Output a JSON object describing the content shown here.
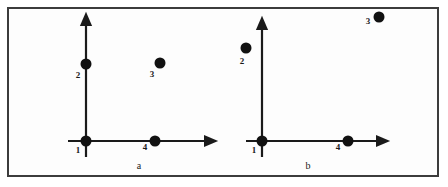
{
  "figure": {
    "title": "",
    "background_color": "#ffffff",
    "frame_color": "#3c3c3c",
    "node_color": "#111111",
    "axis_color": "#1a1a1a",
    "label_color": "#1a1a1a"
  },
  "chart_data": {
    "type": "scatter",
    "title": "",
    "xlabel": "",
    "ylabel": "",
    "grid": false,
    "legend": "none",
    "panels": [
      {
        "id": "a",
        "caption": "a",
        "caption_pos": {
          "x": 139,
          "y": 166
        },
        "origin": {
          "x": 86,
          "y": 141
        },
        "x_axis": {
          "x1": 68,
          "y1": 141,
          "x2": 205,
          "y2": 141,
          "arrow": "right"
        },
        "y_axis": {
          "x1": 86,
          "y1": 157,
          "x2": 86,
          "y2": 25,
          "arrow": "up"
        },
        "points": [
          {
            "label": "1",
            "x": 86,
            "y": 141,
            "r": 5.5,
            "label_x": 78,
            "label_y": 150,
            "on_axis": "origin"
          },
          {
            "label": "2",
            "x": 86,
            "y": 64,
            "r": 5.5,
            "label_x": 78,
            "label_y": 75,
            "on_axis": "y"
          },
          {
            "label": "3",
            "x": 160,
            "y": 63,
            "r": 5.5,
            "label_x": 152,
            "label_y": 74,
            "on_axis": "none"
          },
          {
            "label": "4",
            "x": 155,
            "y": 141,
            "r": 5.5,
            "label_x": 145,
            "label_y": 147,
            "on_axis": "x"
          }
        ]
      },
      {
        "id": "b",
        "caption": "b",
        "caption_pos": {
          "x": 308,
          "y": 166
        },
        "origin": {
          "x": 262,
          "y": 141
        },
        "x_axis": {
          "x1": 246,
          "y1": 141,
          "x2": 377,
          "y2": 141,
          "arrow": "right"
        },
        "y_axis": {
          "x1": 262,
          "y1": 157,
          "x2": 262,
          "y2": 29,
          "arrow": "up"
        },
        "points": [
          {
            "label": "1",
            "x": 262,
            "y": 141,
            "r": 5.5,
            "label_x": 254,
            "label_y": 150,
            "on_axis": "origin"
          },
          {
            "label": "2",
            "x": 246,
            "y": 48,
            "r": 5.5,
            "label_x": 242,
            "label_y": 61,
            "on_axis": "none"
          },
          {
            "label": "3",
            "x": 379,
            "y": 17,
            "r": 5.5,
            "label_x": 368,
            "label_y": 21,
            "on_axis": "none"
          },
          {
            "label": "4",
            "x": 348,
            "y": 141,
            "r": 5.5,
            "label_x": 338,
            "label_y": 147,
            "on_axis": "x"
          }
        ]
      }
    ]
  }
}
